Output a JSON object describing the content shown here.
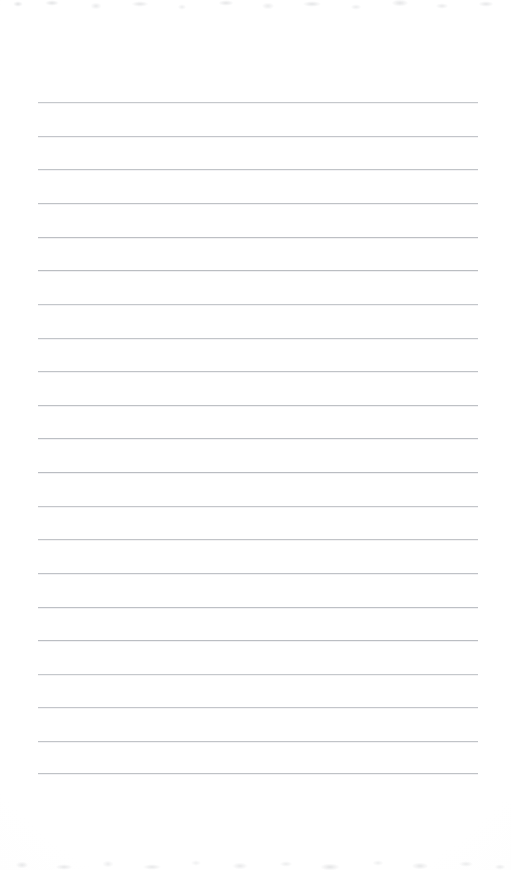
{
  "document": {
    "kind": "lined-notepaper-scan",
    "title": "",
    "body_text": "",
    "page_width": 511,
    "page_height": 870,
    "background_color": "#fefefe",
    "has_visible_text": false,
    "has_handwriting": false
  },
  "ruling": {
    "line_count": 21,
    "line_color": "#b9bcc1",
    "line_thickness": 1,
    "line_start_x": 38,
    "line_end_x": 478,
    "line_length": 440,
    "first_line_y": 102,
    "last_line_y": 773,
    "line_spacing": 33.6,
    "margin_top": 102,
    "margin_bottom": 97,
    "margin_left": 38,
    "margin_right": 33,
    "line_y_positions": [
      102,
      136,
      169,
      203,
      237,
      270,
      304,
      338,
      371,
      405,
      438,
      472,
      506,
      539,
      573,
      607,
      640,
      674,
      707,
      741,
      773
    ]
  },
  "texture": {
    "edge_noise_color": "#a4a7ac",
    "top_noise_height": 16,
    "bottom_noise_height": 18,
    "vignette_color": "#fafafa"
  }
}
